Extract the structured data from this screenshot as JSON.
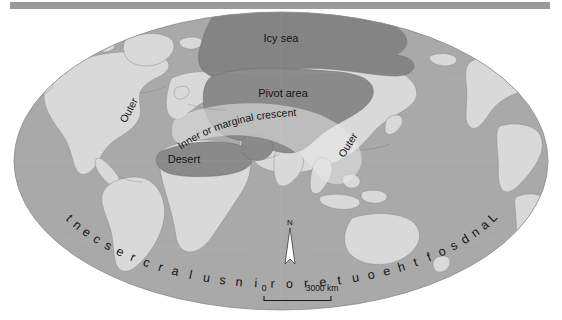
{
  "figure": {
    "type": "map",
    "projection": "elliptical (Mollweide-style) world projection",
    "background_color": "#ffffff",
    "top_rule_color": "#9a9a9a"
  },
  "palette": {
    "ocean": "#a9a9a9",
    "land": "#d9d9d9",
    "highlight_dark": "#8a8a8a",
    "icy_sea": "#848484",
    "outline": "#6f6f6f",
    "text": "#141414",
    "north_arrow_fill": "#ffffff",
    "scalebar": "#1a1a1a"
  },
  "labels": {
    "icy_sea": "Icy sea",
    "pivot_area": "Pivot area",
    "inner_crescent": "Inner or marginal crescent",
    "desert": "Desert",
    "outer_left": "Outer",
    "outer_right": "Outer",
    "outer_insular": "Lands of the outer or insular crescent"
  },
  "outer_insular_letters": [
    "L",
    "a",
    "n",
    "d",
    "s",
    "o",
    "f",
    "t",
    "h",
    "e",
    "o",
    "u",
    "t",
    "e",
    "r",
    "o",
    "r",
    "i",
    "n",
    "s",
    "u",
    "l",
    "a",
    "r",
    "c",
    "r",
    "e",
    "s",
    "c",
    "e",
    "n",
    "t"
  ],
  "north_arrow": {
    "label": "N"
  },
  "scale_bar": {
    "min_label": "0",
    "max_label": "3000 km",
    "unit": "km",
    "max_value": 3000
  }
}
